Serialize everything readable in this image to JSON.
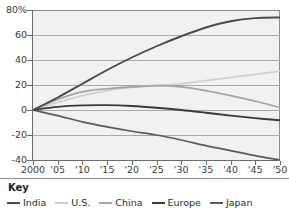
{
  "chart": {
    "type": "line",
    "title": "",
    "xlabel": "",
    "ylabel": "",
    "y_axis": {
      "ticks": [
        "80%",
        "60",
        "40",
        "20",
        "0",
        "-20",
        "-40"
      ],
      "min": -40,
      "max": 80,
      "grid": true
    },
    "x_axis": {
      "ticks": [
        "2000",
        "'05",
        "'10",
        "'15",
        "'20",
        "'25",
        "'30",
        "'35",
        "'40",
        "'45",
        "'50"
      ],
      "min": 2000,
      "max": 2050
    }
  },
  "chart_data": {
    "type": "line",
    "title": "",
    "xlabel": "",
    "ylabel": "",
    "xlim": [
      2000,
      2050
    ],
    "ylim": [
      -40,
      80
    ],
    "grid": true,
    "legend_position": "bottom",
    "x": [
      2000,
      2005,
      2010,
      2015,
      2020,
      2025,
      2030,
      2035,
      2040,
      2045,
      2050
    ],
    "xtick_labels": [
      "2000",
      "'05",
      "'10",
      "'15",
      "'20",
      "'25",
      "'30",
      "'35",
      "'40",
      "'45",
      "'50"
    ],
    "ytick_labels": [
      "80%",
      "60",
      "40",
      "20",
      "0",
      "-20",
      "-40"
    ],
    "ytick_values": [
      80,
      60,
      40,
      20,
      0,
      -20,
      -40
    ],
    "series": [
      {
        "name": "India",
        "color": "#4a4a4a",
        "width": 1.9,
        "values": [
          0,
          10,
          21,
          32,
          42,
          51,
          59,
          66,
          71,
          73.5,
          74
        ]
      },
      {
        "name": "U.S.",
        "color": "#cfcfcf",
        "width": 1.7,
        "values": [
          0,
          6,
          11.5,
          15.5,
          18,
          19.5,
          21,
          23.5,
          26,
          28.5,
          31
        ]
      },
      {
        "name": "China",
        "color": "#a3a3a3",
        "width": 1.7,
        "values": [
          0,
          8.5,
          14.5,
          17,
          18.5,
          19.5,
          18.5,
          15.5,
          11.5,
          7,
          2
        ]
      },
      {
        "name": "Europe",
        "color": "#3a3a3a",
        "width": 1.9,
        "values": [
          0,
          2.5,
          3.7,
          3.9,
          3.2,
          1.8,
          0,
          -2.2,
          -4.5,
          -6.5,
          -8.2
        ]
      },
      {
        "name": "Japan",
        "color": "#5a5a5a",
        "width": 1.7,
        "values": [
          0,
          -4.5,
          -9.5,
          -13.5,
          -17,
          -20,
          -24,
          -28.5,
          -32.5,
          -36.5,
          -40
        ]
      }
    ]
  },
  "key": {
    "title": "Key",
    "entries": [
      {
        "label": "India",
        "color": "#4a4a4a"
      },
      {
        "label": "U.S.",
        "color": "#cfcfcf"
      },
      {
        "label": "China",
        "color": "#a3a3a3"
      },
      {
        "label": "Europe",
        "color": "#3a3a3a"
      },
      {
        "label": "Japan",
        "color": "#5a5a5a"
      }
    ]
  }
}
